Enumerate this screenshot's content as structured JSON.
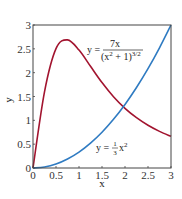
{
  "chart_data": {
    "type": "line",
    "title": "",
    "xlabel": "x",
    "ylabel": "y",
    "xlim": [
      0,
      3
    ],
    "ylim": [
      0,
      3
    ],
    "grid": false,
    "x_ticks": [
      "0",
      "0.5",
      "1",
      "1.5",
      "2",
      "2.5",
      "3"
    ],
    "y_ticks": [
      "0",
      "0.5",
      "1",
      "1.5",
      "2",
      "2.5",
      "3"
    ],
    "x": [
      0,
      0.25,
      0.5,
      0.75,
      1,
      1.25,
      1.5,
      1.75,
      2,
      2.25,
      2.5,
      2.75,
      3
    ],
    "series": [
      {
        "name": "y = 7x/(x^2+1)^(3/2)",
        "color": "#a2142f",
        "values": [
          0,
          1.598,
          2.504,
          2.688,
          2.475,
          2.133,
          1.792,
          1.496,
          1.252,
          1.055,
          0.896,
          0.768,
          0.664
        ]
      },
      {
        "name": "y = (1/3)x^2",
        "color": "#2f7bc2",
        "values": [
          0,
          0.021,
          0.083,
          0.188,
          0.333,
          0.521,
          0.75,
          1.021,
          1.333,
          1.688,
          2.083,
          2.521,
          3
        ]
      }
    ],
    "annotations": [
      {
        "text_y": "y =",
        "numerator": "7x",
        "denominator": "(x",
        "den_exp": "2",
        "den_rest": " + 1)",
        "den_pow": "3/2",
        "x": 1.45,
        "y": 2.6
      },
      {
        "text": "y =",
        "frac_num": "1",
        "frac_den": "3",
        "var": "x",
        "exp": "2",
        "x": 1.9,
        "y": 0.5
      }
    ]
  }
}
